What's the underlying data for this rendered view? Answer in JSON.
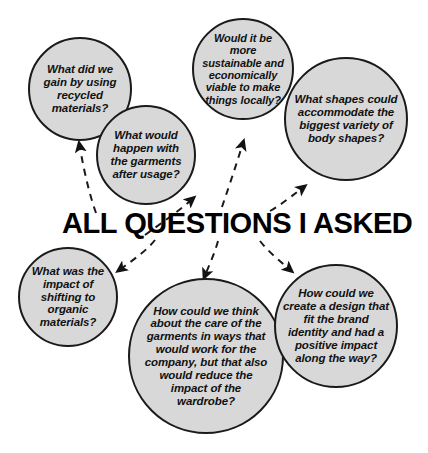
{
  "diagram": {
    "title": "ALL QUESTIONS I ASKED",
    "background_color": "#ffffff",
    "bubble_fill": "#d8d8d8",
    "bubble_stroke": "#1a1a1a",
    "connector_style": "dashed-curved-arrow",
    "bubbles": [
      {
        "id": "recycled-materials",
        "text": "What did we gain by using recycled materials?",
        "cx": 80,
        "cy": 89,
        "r": 52,
        "font_size": 11.5,
        "z": 1
      },
      {
        "id": "garments-after-usage",
        "text": "What would happen with the garments after usage?",
        "cx": 146,
        "cy": 155,
        "r": 50,
        "font_size": 11.5,
        "z": 3
      },
      {
        "id": "sustainable-local",
        "text": "Would it be more sustainable and economically viable to make things locally?",
        "cx": 243,
        "cy": 69,
        "r": 51,
        "font_size": 11,
        "z": 1
      },
      {
        "id": "body-shapes",
        "text": "What shapes could accommodate the biggest variety of body shapes?",
        "cx": 346,
        "cy": 119,
        "r": 62,
        "font_size": 11.5,
        "z": 3
      },
      {
        "id": "organic-materials",
        "text": "What was the impact of shifting to organic materials?",
        "cx": 68,
        "cy": 297,
        "r": 50,
        "font_size": 11.5,
        "z": 1
      },
      {
        "id": "garment-care",
        "text": "How could we think about the care of the garments in ways that would work for the company, but that also would reduce the impact of the wardrobe?",
        "cx": 206,
        "cy": 356,
        "r": 78,
        "font_size": 11.5,
        "z": 1
      },
      {
        "id": "brand-identity-design",
        "text": "How could we create a design that fit the brand identity and had a positive impact along the way?",
        "cx": 336,
        "cy": 326,
        "r": 62,
        "font_size": 11.5,
        "z": 3
      }
    ],
    "connectors": [
      {
        "id": "to-recycled-materials",
        "direction": "up",
        "target": "recycled-materials"
      },
      {
        "id": "to-garments-after-usage",
        "direction": "up",
        "target": "garments-after-usage"
      },
      {
        "id": "to-sustainable-local",
        "direction": "up",
        "target": "sustainable-local"
      },
      {
        "id": "to-body-shapes",
        "direction": "up",
        "target": "body-shapes"
      },
      {
        "id": "to-organic-materials",
        "direction": "down",
        "target": "organic-materials"
      },
      {
        "id": "to-garment-care",
        "direction": "down",
        "target": "garment-care"
      },
      {
        "id": "to-brand-identity-design",
        "direction": "down",
        "target": "brand-identity-design"
      }
    ],
    "title_style": {
      "x": 62,
      "y": 206,
      "font_size": 30
    }
  }
}
